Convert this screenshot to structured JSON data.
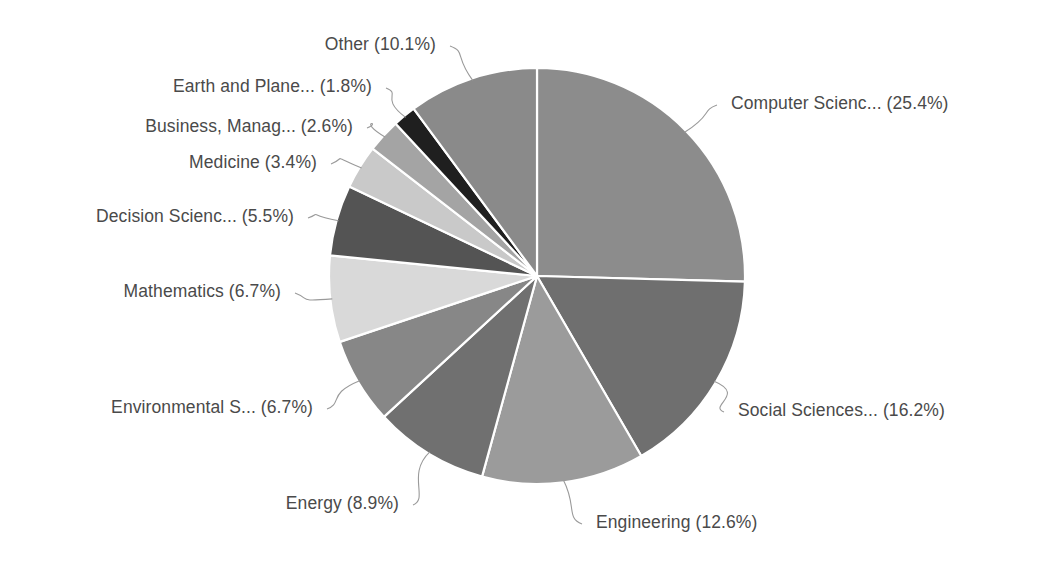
{
  "chart_data": {
    "type": "pie",
    "title": "",
    "subtitle": "",
    "xlabel": "",
    "ylabel": "",
    "legend_position": "none",
    "grid": false,
    "label_format": "{name} ({value}%)",
    "start_angle_deg": 0,
    "direction": "clockwise",
    "categories": [
      "Computer Scienc...",
      "Social Sciences...",
      "Engineering",
      "Energy",
      "Environmental S...",
      "Mathematics",
      "Decision Scienc...",
      "Medicine",
      "Business, Manag...",
      "Earth and Plane...",
      "Other"
    ],
    "values": [
      25.4,
      16.2,
      12.6,
      8.9,
      6.7,
      6.7,
      5.5,
      3.4,
      2.6,
      1.8,
      10.1
    ],
    "colors": [
      "#8c8c8c",
      "#6f6f6f",
      "#9b9b9b",
      "#707070",
      "#878787",
      "#d9d9d9",
      "#545454",
      "#c9c9c9",
      "#a4a4a4",
      "#1f1f1f",
      "#8a8a8a"
    ],
    "slices": [
      {
        "name": "Computer Scienc...",
        "value": 25.4,
        "label": "Computer Scienc... (25.4%)",
        "color": "#8c8c8c"
      },
      {
        "name": "Social Sciences...",
        "value": 16.2,
        "label": "Social Sciences... (16.2%)",
        "color": "#6f6f6f"
      },
      {
        "name": "Engineering",
        "value": 12.6,
        "label": "Engineering (12.6%)",
        "color": "#9b9b9b"
      },
      {
        "name": "Energy",
        "value": 8.9,
        "label": "Energy (8.9%)",
        "color": "#707070"
      },
      {
        "name": "Environmental S...",
        "value": 6.7,
        "label": "Environmental S... (6.7%)",
        "color": "#878787"
      },
      {
        "name": "Mathematics",
        "value": 6.7,
        "label": "Mathematics (6.7%)",
        "color": "#d9d9d9"
      },
      {
        "name": "Decision Scienc...",
        "value": 5.5,
        "label": "Decision Scienc... (5.5%)",
        "color": "#545454"
      },
      {
        "name": "Medicine",
        "value": 3.4,
        "label": "Medicine (3.4%)",
        "color": "#c9c9c9"
      },
      {
        "name": "Business, Manag...",
        "value": 2.6,
        "label": "Business, Manag... (2.6%)",
        "color": "#a4a4a4"
      },
      {
        "name": "Earth and Plane...",
        "value": 1.8,
        "label": "Earth and Plane... (1.8%)",
        "color": "#1f1f1f"
      },
      {
        "name": "Other",
        "value": 10.1,
        "label": "Other (10.1%)",
        "color": "#8a8a8a"
      }
    ]
  },
  "geometry": {
    "center_x": 537,
    "center_y": 276,
    "radius": 208,
    "label_anchors": [
      {
        "index": 0,
        "x": 731,
        "y": 105,
        "align": "left"
      },
      {
        "index": 1,
        "x": 738,
        "y": 412,
        "align": "left"
      },
      {
        "index": 2,
        "x": 596,
        "y": 524,
        "align": "left"
      },
      {
        "index": 3,
        "x": 399,
        "y": 505,
        "align": "right"
      },
      {
        "index": 4,
        "x": 313,
        "y": 409,
        "align": "right"
      },
      {
        "index": 5,
        "x": 281,
        "y": 293,
        "align": "right"
      },
      {
        "index": 6,
        "x": 294,
        "y": 218,
        "align": "right"
      },
      {
        "index": 7,
        "x": 317,
        "y": 164,
        "align": "right"
      },
      {
        "index": 8,
        "x": 353,
        "y": 128,
        "align": "right"
      },
      {
        "index": 9,
        "x": 372,
        "y": 88,
        "align": "right"
      },
      {
        "index": 10,
        "x": 436,
        "y": 46,
        "align": "right"
      }
    ]
  },
  "style": {
    "background": "#ffffff",
    "label_color": "#4a4a4a",
    "slice_border_color": "#ffffff",
    "leader_color": "#9a9a9a"
  }
}
